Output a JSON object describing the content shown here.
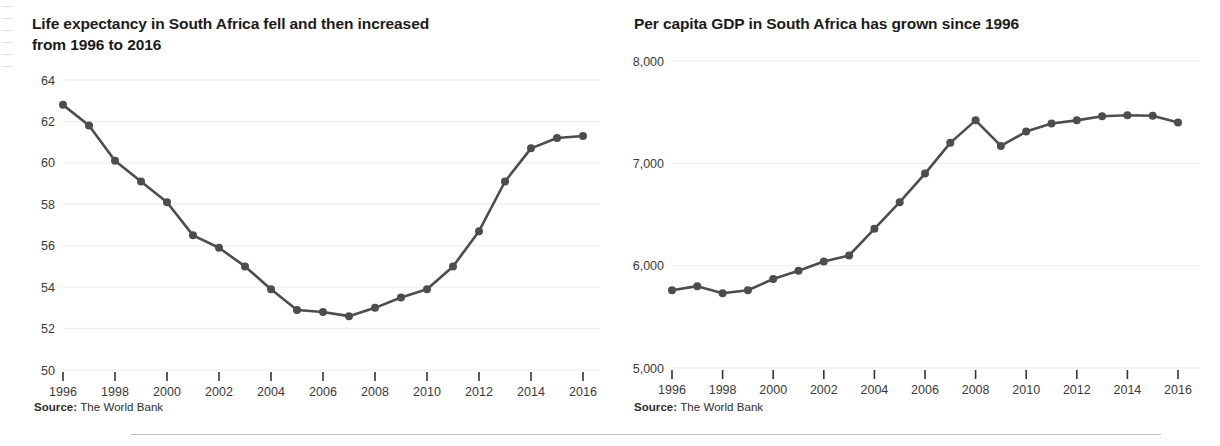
{
  "figure": {
    "background_color": "#ffffff",
    "text_color": "#231f20",
    "series_color": "#4d4d4d",
    "gridline_color": "#f0f0f0",
    "axis_color": "#333333",
    "divider_color": "#b9bbbd"
  },
  "panels": [
    {
      "id": "life-expectancy",
      "title": "Life expectancy in South Africa fell and then increased from 1996 to 2016",
      "source_label": "Source:",
      "source_value": "The World Bank"
    },
    {
      "id": "per-capita-gdp",
      "title": "Per capita GDP in South Africa has grown since 1996",
      "source_label": "Source:",
      "source_value": "The World Bank"
    }
  ],
  "chart_data": [
    {
      "type": "line",
      "id": "life-expectancy",
      "title": "Life expectancy in South Africa fell and then increased from 1996 to 2016",
      "xlabel": "",
      "ylabel": "",
      "xlim": [
        1996,
        2016
      ],
      "ylim": [
        50,
        64
      ],
      "ytick_values": [
        50,
        52,
        54,
        56,
        58,
        60,
        62,
        64
      ],
      "ytick_labels": [
        "50",
        "52",
        "54",
        "56",
        "58",
        "60",
        "62",
        "64"
      ],
      "xtick_values": [
        1996,
        1998,
        2000,
        2002,
        2004,
        2006,
        2008,
        2010,
        2012,
        2014,
        2016
      ],
      "xtick_labels": [
        "1996",
        "1998",
        "2000",
        "2002",
        "2004",
        "2006",
        "2008",
        "2010",
        "2012",
        "2014",
        "2016"
      ],
      "grid": true,
      "legend": false,
      "markers": true,
      "x": [
        1996,
        1997,
        1998,
        1999,
        2000,
        2001,
        2002,
        2003,
        2004,
        2005,
        2006,
        2007,
        2008,
        2009,
        2010,
        2011,
        2012,
        2013,
        2014,
        2015,
        2016
      ],
      "values": [
        62.8,
        61.8,
        60.1,
        59.1,
        58.1,
        56.5,
        55.9,
        55.0,
        53.9,
        52.9,
        52.8,
        52.6,
        53.0,
        53.5,
        53.9,
        55.0,
        56.7,
        59.1,
        60.7,
        61.2,
        61.3
      ]
    },
    {
      "type": "line",
      "id": "per-capita-gdp",
      "title": "Per capita GDP in South Africa has grown since 1996",
      "xlabel": "",
      "ylabel": "",
      "xlim": [
        1996,
        2016
      ],
      "ylim": [
        5000,
        8000
      ],
      "ytick_values": [
        5000,
        6000,
        7000,
        8000
      ],
      "ytick_labels": [
        "5,000",
        "6,000",
        "7,000",
        "8,000"
      ],
      "xtick_values": [
        1996,
        1998,
        2000,
        2002,
        2004,
        2006,
        2008,
        2010,
        2012,
        2014,
        2016
      ],
      "xtick_labels": [
        "1996",
        "1998",
        "2000",
        "2002",
        "2004",
        "2006",
        "2008",
        "2010",
        "2012",
        "2014",
        "2016"
      ],
      "grid": true,
      "legend": false,
      "markers": true,
      "x": [
        1996,
        1997,
        1998,
        1999,
        2000,
        2001,
        2002,
        2003,
        2004,
        2005,
        2006,
        2007,
        2008,
        2009,
        2010,
        2011,
        2012,
        2013,
        2014,
        2015,
        2016
      ],
      "values": [
        5760,
        5800,
        5730,
        5760,
        5870,
        5950,
        6040,
        6100,
        6360,
        6620,
        6900,
        7200,
        7420,
        7170,
        7310,
        7390,
        7420,
        7460,
        7470,
        7465,
        7400
      ]
    }
  ]
}
